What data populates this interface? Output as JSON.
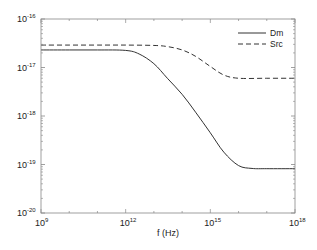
{
  "chart_data": {
    "type": "line",
    "title": "",
    "xlabel": "f (Hz)",
    "ylabel": "",
    "xscale": "log",
    "yscale": "log",
    "xlim": [
      1000000000.0,
      1e+18
    ],
    "ylim": [
      1e-20,
      1e-16
    ],
    "grid": false,
    "legend_position": "upper right",
    "x_ticks": [
      {
        "base": "10",
        "exp": "9",
        "value": 1000000000.0
      },
      {
        "base": "10",
        "exp": "12",
        "value": 1000000000000.0
      },
      {
        "base": "10",
        "exp": "15",
        "value": 1000000000000000.0
      },
      {
        "base": "10",
        "exp": "18",
        "value": 1e+18
      }
    ],
    "y_ticks": [
      {
        "base": "10",
        "exp": "-16",
        "value": 1e-16
      },
      {
        "base": "10",
        "exp": "-17",
        "value": 1e-17
      },
      {
        "base": "10",
        "exp": "-18",
        "value": 1e-18
      },
      {
        "base": "10",
        "exp": "-19",
        "value": 1e-19
      },
      {
        "base": "10",
        "exp": "-20",
        "value": 1e-20
      }
    ],
    "series": [
      {
        "name": "Dm",
        "style": "solid",
        "color": "#333333",
        "x": [
          1000000000.0,
          10000000000.0,
          100000000000.0,
          1000000000000.0,
          3000000000000.0,
          10000000000000.0,
          30000000000000.0,
          100000000000000.0,
          300000000000000.0,
          1000000000000000.0,
          3000000000000000.0,
          1e+16,
          3e+16,
          1e+17,
          1e+18
        ],
        "y": [
          2.3e-17,
          2.3e-17,
          2.3e-17,
          2.25e-17,
          1.9e-17,
          1.2e-17,
          6e-18,
          2.8e-18,
          1.2e-18,
          4.5e-19,
          1.8e-19,
          9.5e-20,
          8.3e-20,
          8.2e-20,
          8.2e-20
        ]
      },
      {
        "name": "Src",
        "style": "dashed",
        "color": "#333333",
        "x": [
          1000000000.0,
          10000000000.0,
          100000000000.0,
          1000000000000.0,
          10000000000000.0,
          30000000000000.0,
          100000000000000.0,
          300000000000000.0,
          1000000000000000.0,
          3000000000000000.0,
          1e+16,
          1e+17,
          1e+18
        ],
        "y": [
          2.9e-17,
          2.9e-17,
          2.9e-17,
          2.9e-17,
          2.85e-17,
          2.7e-17,
          2.3e-17,
          1.7e-17,
          1.05e-17,
          7e-18,
          6e-18,
          6e-18,
          6e-18
        ]
      }
    ]
  },
  "legend": {
    "items": [
      {
        "label": "Dm",
        "style": "solid"
      },
      {
        "label": "Src",
        "style": "dashed"
      }
    ]
  },
  "colors": {
    "line": "#333333",
    "axis": "#888888",
    "text": "#222222"
  }
}
